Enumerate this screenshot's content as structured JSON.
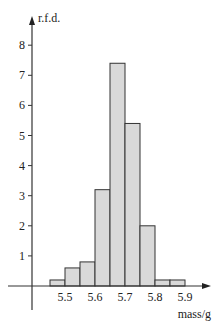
{
  "chart_data": {
    "type": "bar",
    "subtype": "histogram",
    "title": "",
    "xlabel": "mass/g",
    "ylabel": "r.f.d.",
    "bin_width": 0.05,
    "bins": [
      {
        "from": 5.45,
        "to": 5.5,
        "value": 0.2
      },
      {
        "from": 5.5,
        "to": 5.55,
        "value": 0.6
      },
      {
        "from": 5.55,
        "to": 5.6,
        "value": 0.8
      },
      {
        "from": 5.6,
        "to": 5.65,
        "value": 3.2
      },
      {
        "from": 5.65,
        "to": 5.7,
        "value": 7.4
      },
      {
        "from": 5.7,
        "to": 5.75,
        "value": 5.4
      },
      {
        "from": 5.75,
        "to": 5.8,
        "value": 2.0
      },
      {
        "from": 5.8,
        "to": 5.85,
        "value": 0.2
      },
      {
        "from": 5.85,
        "to": 5.9,
        "value": 0.2
      }
    ],
    "categories": [
      "5.45-5.50",
      "5.50-5.55",
      "5.55-5.60",
      "5.60-5.65",
      "5.65-5.70",
      "5.70-5.75",
      "5.75-5.80",
      "5.80-5.85",
      "5.85-5.90"
    ],
    "values": [
      0.2,
      0.6,
      0.8,
      3.2,
      7.4,
      5.4,
      2.0,
      0.2,
      0.2
    ],
    "x_ticks": [
      "5.5",
      "5.6",
      "5.7",
      "5.8",
      "5.9"
    ],
    "y_ticks": [
      "1",
      "2",
      "3",
      "4",
      "5",
      "6",
      "7",
      "8"
    ],
    "ylim": [
      0,
      8.6
    ],
    "xlim": [
      5.35,
      5.97
    ],
    "grid": false,
    "legend": "none",
    "colors": {
      "bar_fill": "#d9d9d9",
      "bar_stroke": "#333333",
      "axis": "#333333"
    }
  }
}
